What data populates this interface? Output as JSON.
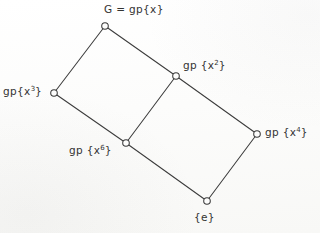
{
  "diagram": {
    "kind": "subgroup-lattice-hasse-diagram",
    "title": "",
    "background_color": "#fdfdfc",
    "line_color": "#3c3c3c",
    "text_color": "#333332",
    "node_fill": "#fdfdfc",
    "nodes": [
      {
        "id": "G",
        "label_prefix": "G = gp{x",
        "label_sup": "",
        "label_suffix": "}",
        "label_plain": "G = gp{x}",
        "x": 105,
        "y": 26,
        "label_position": "above"
      },
      {
        "id": "x3",
        "label_prefix": "gp{x",
        "label_sup": "3",
        "label_suffix": "}",
        "label_plain": "gp{x3}",
        "x": 54,
        "y": 93,
        "label_position": "left"
      },
      {
        "id": "x2",
        "label_prefix": "gp {x",
        "label_sup": "2",
        "label_suffix": "}",
        "label_plain": "gp {x2}",
        "x": 176,
        "y": 76,
        "label_position": "right"
      },
      {
        "id": "x6",
        "label_prefix": "gp {x",
        "label_sup": "6",
        "label_suffix": "}",
        "label_plain": "gp {x6}",
        "x": 126,
        "y": 143,
        "label_position": "left"
      },
      {
        "id": "x4",
        "label_prefix": "gp {x",
        "label_sup": "4",
        "label_suffix": "}",
        "label_plain": "gp {x4}",
        "x": 257,
        "y": 134,
        "label_position": "right"
      },
      {
        "id": "e",
        "label_prefix": "{e}",
        "label_sup": "",
        "label_suffix": "",
        "label_plain": "{e}",
        "x": 207,
        "y": 201,
        "label_position": "below"
      }
    ],
    "edges": [
      {
        "from": "G",
        "to": "x3",
        "x1": 105,
        "y1": 26,
        "x2": 54,
        "y2": 93
      },
      {
        "from": "G",
        "to": "x2",
        "x1": 105,
        "y1": 26,
        "x2": 176,
        "y2": 76
      },
      {
        "from": "x3",
        "to": "x6",
        "x1": 54,
        "y1": 93,
        "x2": 126,
        "y2": 143
      },
      {
        "from": "x2",
        "to": "x6",
        "x1": 176,
        "y1": 76,
        "x2": 126,
        "y2": 143
      },
      {
        "from": "x2",
        "to": "x4",
        "x1": 176,
        "y1": 76,
        "x2": 257,
        "y2": 134
      },
      {
        "from": "x6",
        "to": "e",
        "x1": 126,
        "y1": 143,
        "x2": 207,
        "y2": 201
      },
      {
        "from": "x4",
        "to": "e",
        "x1": 257,
        "y1": 134,
        "x2": 207,
        "y2": 201
      }
    ]
  }
}
